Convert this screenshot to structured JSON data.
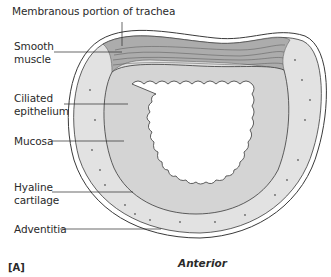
{
  "figure": {
    "panel_label": "[A]",
    "orientation_label": "Anterior"
  },
  "labels": [
    {
      "id": "membranous",
      "text": "Membranous portion of trachea",
      "x": 12,
      "y": 10
    },
    {
      "id": "smooth-muscle",
      "text": "Smooth muscle",
      "line1": "Smooth",
      "line2": "muscle",
      "x": 14,
      "y": 44
    },
    {
      "id": "ciliated-epithelium",
      "text": "Ciliated epithelium",
      "line1": "Ciliated",
      "line2": "epithelium",
      "x": 14,
      "y": 95
    },
    {
      "id": "mucosa",
      "text": "Mucosa",
      "x": 14,
      "y": 136
    },
    {
      "id": "hyaline-cartilage",
      "text": "Hyaline cartilage",
      "line1": "Hyaline",
      "line2": "cartilage",
      "x": 14,
      "y": 183
    },
    {
      "id": "adventitia",
      "text": "Adventitia",
      "x": 14,
      "y": 224
    }
  ],
  "colors": {
    "cartilage": "#e2e2e2",
    "outline": "#3a3a3a",
    "mucosa": "#d4d4d4",
    "muscle": "#9a9a9a",
    "lumen": "#ffffff",
    "text": "#2a2a2a"
  }
}
